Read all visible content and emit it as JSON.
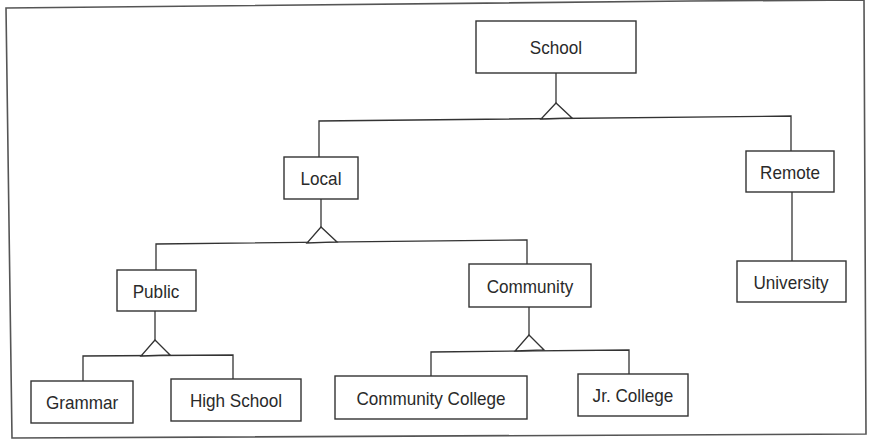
{
  "diagram": {
    "type": "inheritance-hierarchy",
    "root": "School",
    "nodes": {
      "school": {
        "label": "School",
        "parent": null
      },
      "local": {
        "label": "Local",
        "parent": "School"
      },
      "remote": {
        "label": "Remote",
        "parent": "School"
      },
      "public": {
        "label": "Public",
        "parent": "Local"
      },
      "community": {
        "label": "Community",
        "parent": "Local"
      },
      "university": {
        "label": "University",
        "parent": "Remote"
      },
      "grammar": {
        "label": "Grammar",
        "parent": "Public"
      },
      "high_school": {
        "label": "High School",
        "parent": "Public"
      },
      "community_college": {
        "label": "Community College",
        "parent": "Community"
      },
      "jr_college": {
        "label": "Jr. College",
        "parent": "Community"
      }
    },
    "generalization_symbol": "triangle",
    "colors": {
      "line": "#333333",
      "text": "#2a2a2a",
      "background": "#ffffff"
    }
  }
}
